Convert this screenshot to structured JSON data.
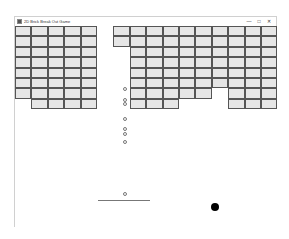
{
  "window": {
    "title": "2D Brick Break Out Game",
    "controls": {
      "minimize": "—",
      "maximize": "□",
      "close": "✕"
    }
  },
  "game": {
    "grid": {
      "cols": 16,
      "rows": 8,
      "brick_w": 16.4,
      "brick_h": 10.4,
      "origin_x": 0,
      "origin_y": 0,
      "map": [
        "1111101111111111",
        "1111101111111111",
        "1111100111111111",
        "1111100111111111",
        "1111100111111111",
        "1111100111111111",
        "1111100111110111",
        "0111100111000111"
      ]
    },
    "small_balls": [
      {
        "x": 108,
        "y": 61
      },
      {
        "x": 108,
        "y": 72
      },
      {
        "x": 108,
        "y": 76
      },
      {
        "x": 108,
        "y": 91
      },
      {
        "x": 108,
        "y": 101
      },
      {
        "x": 108,
        "y": 106
      },
      {
        "x": 108,
        "y": 114
      },
      {
        "x": 108,
        "y": 166
      }
    ],
    "paddle": {
      "x": 83,
      "y": 174,
      "width": 52
    },
    "ball": {
      "x": 196,
      "y": 177
    }
  },
  "colors": {
    "brick_fill": "#e6e6e6",
    "brick_border": "#555555",
    "ball": "#000000",
    "paddle": "#777777"
  }
}
